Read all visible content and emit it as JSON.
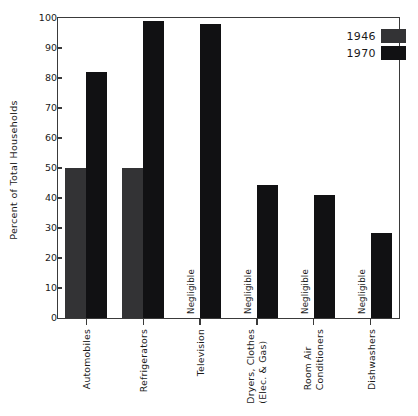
{
  "chart_data": {
    "type": "bar",
    "title": "",
    "xlabel": "",
    "ylabel": "Percent of Total Households",
    "ylim": [
      0,
      100
    ],
    "yticks": [
      0,
      10,
      20,
      30,
      40,
      50,
      60,
      70,
      80,
      90,
      100
    ],
    "grid": false,
    "legend_position": "top-right",
    "categories": [
      "Automobiles",
      "Refrigerators",
      "Television",
      "Dryers, Clothes (Elec. & Gas)",
      "Room Air Conditioners",
      "Dishwashers"
    ],
    "category_lines": [
      [
        "Automobiles"
      ],
      [
        "Refrigerators"
      ],
      [
        "Television"
      ],
      [
        "Dryers, Clothes",
        "(Elec. & Gas)"
      ],
      [
        "Room Air",
        "Conditioners"
      ],
      [
        "Dishwashers"
      ]
    ],
    "series": [
      {
        "name": "1946",
        "color": "#333335",
        "values": [
          50,
          50,
          null,
          null,
          null,
          null
        ],
        "value_notes": [
          "",
          "",
          "Negligible",
          "Negligible",
          "Negligible",
          "Negligible"
        ]
      },
      {
        "name": "1970",
        "color": "#111113",
        "values": [
          82,
          99,
          98,
          44.5,
          41,
          28.5
        ],
        "value_notes": [
          "",
          "",
          "",
          "",
          "",
          ""
        ]
      }
    ],
    "negligible_text": "Negligible"
  },
  "axis": {
    "y_tick_labels": [
      "0",
      "10",
      "20",
      "30",
      "40",
      "50",
      "60",
      "70",
      "80",
      "90",
      "100"
    ],
    "y_axis_title": "Percent of Total Households"
  },
  "legend": {
    "items": [
      {
        "label": "1946",
        "color": "#333335"
      },
      {
        "label": "1970",
        "color": "#111113"
      }
    ]
  }
}
